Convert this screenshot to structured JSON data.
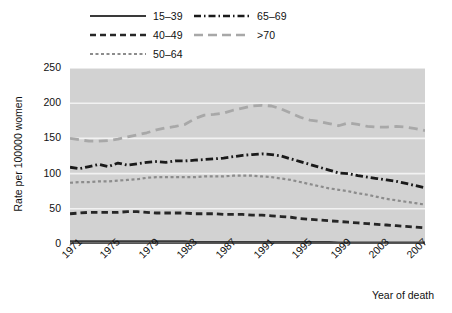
{
  "chart_data": {
    "type": "line",
    "title": "",
    "xlabel": "Year of death",
    "ylabel": "Rate per 100000 women",
    "xlim": [
      1971,
      2008
    ],
    "ylim": [
      0,
      250
    ],
    "yticks": [
      0,
      50,
      100,
      150,
      200,
      250
    ],
    "xticks": [
      1971,
      1975,
      1979,
      1983,
      1987,
      1991,
      1995,
      1999,
      2003,
      2007
    ],
    "grid": "horizontal-white",
    "plot_background": "#d2d2d2",
    "legend_position": "above-plot",
    "x": [
      1971,
      1972,
      1973,
      1974,
      1975,
      1976,
      1977,
      1978,
      1979,
      1980,
      1981,
      1982,
      1983,
      1984,
      1985,
      1986,
      1987,
      1988,
      1989,
      1990,
      1991,
      1992,
      1993,
      1994,
      1995,
      1996,
      1997,
      1998,
      1999,
      2000,
      2001,
      2002,
      2003,
      2004,
      2005,
      2006,
      2007,
      2008
    ],
    "series": [
      {
        "name": "15-39",
        "label": "15–39",
        "style": "solid",
        "color": "#3a3a3a",
        "values": [
          4,
          4,
          4,
          4,
          4,
          4,
          4,
          4,
          4,
          4,
          4,
          4,
          4,
          3,
          3,
          3,
          3,
          3,
          3,
          3,
          3,
          3,
          3,
          3,
          3,
          3,
          3,
          3,
          2,
          2,
          2,
          2,
          2,
          2,
          2,
          2,
          2,
          2
        ]
      },
      {
        "name": "40-49",
        "label": "40–49",
        "style": "dashed",
        "color": "#262626",
        "values": [
          43,
          44,
          45,
          45,
          45,
          45,
          46,
          46,
          45,
          44,
          44,
          44,
          44,
          43,
          43,
          43,
          42,
          42,
          42,
          41,
          41,
          40,
          39,
          38,
          36,
          35,
          34,
          33,
          32,
          31,
          30,
          29,
          28,
          27,
          26,
          25,
          24,
          23
        ]
      },
      {
        "name": "50-64",
        "label": "50–64",
        "style": "dotted",
        "color": "#8c8c8c",
        "values": [
          87,
          88,
          88,
          89,
          89,
          90,
          91,
          92,
          94,
          95,
          95,
          95,
          95,
          95,
          96,
          96,
          96,
          97,
          97,
          97,
          96,
          95,
          93,
          91,
          88,
          85,
          82,
          79,
          77,
          75,
          72,
          70,
          67,
          64,
          62,
          60,
          58,
          56
        ]
      },
      {
        "name": "65-69",
        "label": "65–69",
        "style": "dashdot",
        "color": "#1a1a1a",
        "values": [
          109,
          107,
          110,
          113,
          110,
          115,
          112,
          114,
          116,
          117,
          116,
          118,
          118,
          119,
          120,
          121,
          122,
          124,
          126,
          127,
          128,
          127,
          125,
          121,
          117,
          113,
          109,
          105,
          101,
          100,
          97,
          95,
          93,
          91,
          89,
          86,
          83,
          80
        ]
      },
      {
        "name": ">70",
        "label": ">70",
        "style": "longdash",
        "color": "#a8a8a8",
        "values": [
          150,
          148,
          146,
          146,
          147,
          149,
          152,
          155,
          158,
          162,
          165,
          167,
          170,
          178,
          183,
          184,
          186,
          190,
          193,
          196,
          197,
          196,
          192,
          186,
          180,
          176,
          174,
          171,
          168,
          172,
          170,
          167,
          166,
          166,
          167,
          166,
          164,
          161
        ]
      }
    ]
  }
}
